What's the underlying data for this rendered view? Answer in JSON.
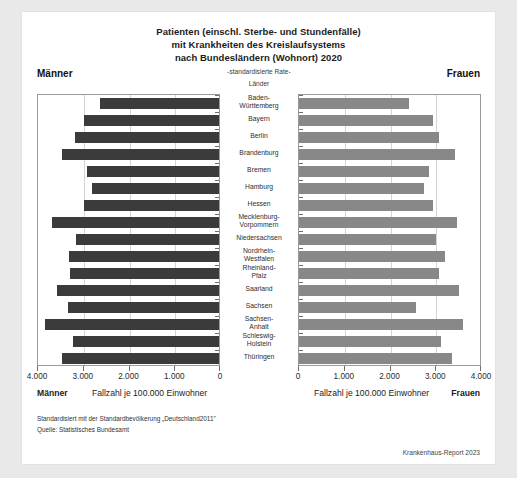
{
  "title_lines": [
    "Patienten (einschl. Sterbe- und Stundenfälle)",
    "mit Krankheiten des Kreislaufsystems",
    "nach Bundesländern (Wohnort) 2020"
  ],
  "header": {
    "left_label": "Männer",
    "right_label": "Frauen",
    "center_rate": "-standardisierte Rate-",
    "center_lander": "Länder"
  },
  "captions": {
    "left_bold": "Männer",
    "left_axis_caption": "Fallzahl je 100.000 Einwohner",
    "right_axis_caption": "Fallzahl je 100.000 Einwohner",
    "right_bold": "Frauen"
  },
  "footnotes": {
    "line1": "Standardisiert mit der Standardbevölkerung „Deutschland2011\"",
    "line2": "Quelle: Statistisches Bundesamt",
    "credit": "Krankenhaus-Report 2023"
  },
  "colors": {
    "men_bar": "#3b3b3b",
    "women_bar": "#888888",
    "frame": "#9a9a9a",
    "grid": "#d4d4d4",
    "card": "#ffffff",
    "page": "#e9e9e9"
  },
  "chart_data": {
    "type": "bar",
    "orientation": "horizontal",
    "layout": "population-pyramid / back-to-back bar chart",
    "subtitle": "-standardisierte Rate-",
    "xlabel": "Fallzahl je 100.000 Einwohner",
    "ylabel": "Länder",
    "xlim": [
      0,
      4000
    ],
    "xticks": [
      0,
      1000,
      2000,
      3000,
      4000
    ],
    "xticklabels": [
      "0",
      "1.000",
      "2.000",
      "3.000",
      "4.000"
    ],
    "left_axis_reversed": true,
    "grid": true,
    "legend": false,
    "categories": [
      "Baden-Württemberg",
      "Bayern",
      "Berlin",
      "Brandenburg",
      "Bremen",
      "Hamburg",
      "Hessen",
      "Mecklenburg-Vorpommern",
      "Niedersachsen",
      "Nordrhein-Westfalen",
      "Rheinland-Pfalz",
      "Saarland",
      "Sachsen",
      "Sachsen-Anhalt",
      "Schleswig-Holstein",
      "Thüringen"
    ],
    "category_lines": [
      [
        "Baden-",
        "Württemberg"
      ],
      [
        "Bayern"
      ],
      [
        "Berlin"
      ],
      [
        "Brandenburg"
      ],
      [
        "Bremen"
      ],
      [
        "Hamburg"
      ],
      [
        "Hessen"
      ],
      [
        "Mecklenburg-",
        "Vorpommern"
      ],
      [
        "Niedersachsen"
      ],
      [
        "Nordrhein-",
        "Westfalen"
      ],
      [
        "Rheinland-",
        "Pfalz"
      ],
      [
        "Saarland"
      ],
      [
        "Sachsen"
      ],
      [
        "Sachsen-",
        "Anhalt"
      ],
      [
        "Schleswig-",
        "Holstein"
      ],
      [
        "Thüringen"
      ]
    ],
    "series": [
      {
        "name": "Männer",
        "side": "left",
        "color": "#3b3b3b",
        "values": [
          2600,
          2960,
          3140,
          3440,
          2880,
          2780,
          2960,
          3650,
          3130,
          3290,
          3250,
          3540,
          3300,
          3800,
          3200,
          3430
        ]
      },
      {
        "name": "Frauen",
        "side": "right",
        "color": "#888888",
        "values": [
          2400,
          2920,
          3060,
          3400,
          2850,
          2740,
          2930,
          3460,
          3000,
          3200,
          3060,
          3490,
          2560,
          3580,
          3100,
          3340
        ]
      }
    ]
  }
}
